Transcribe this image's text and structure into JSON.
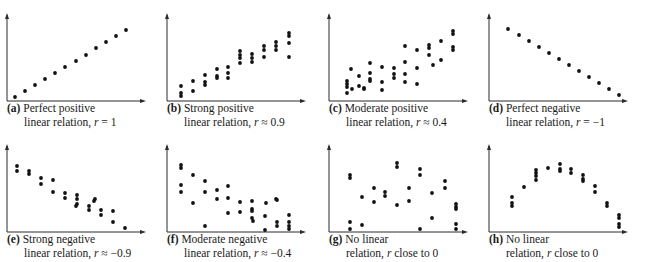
{
  "chart_data": [
    {
      "type": "scatter",
      "label": "(a)",
      "title": "Perfect positive linear relation, r = 1",
      "caption_line1": "Perfect positive",
      "caption_line2_pre": "linear relation, ",
      "caption_r": "r",
      "caption_line2_post": " = 1",
      "xlabel": "",
      "ylabel": "",
      "grid": false,
      "points": [
        [
          15,
          97
        ],
        [
          25,
          91
        ],
        [
          35,
          85
        ],
        [
          45,
          79
        ],
        [
          55,
          73
        ],
        [
          65,
          67
        ],
        [
          76,
          61
        ],
        [
          86,
          55
        ],
        [
          96,
          48
        ],
        [
          106,
          42
        ],
        [
          116,
          36
        ],
        [
          126,
          30
        ]
      ]
    },
    {
      "type": "scatter",
      "label": "(b)",
      "title": "Strong positive linear relation, r ≈ 0.9",
      "caption_line1": "Strong positive",
      "caption_line2_pre": "linear relation, ",
      "caption_r": "r",
      "caption_line2_post": " ≈ 0.9",
      "xlabel": "",
      "ylabel": "",
      "grid": false,
      "points": [
        [
          21,
          86
        ],
        [
          21,
          93
        ],
        [
          21,
          96
        ],
        [
          33,
          81
        ],
        [
          33,
          91
        ],
        [
          45,
          75
        ],
        [
          45,
          82
        ],
        [
          45,
          85
        ],
        [
          57,
          69
        ],
        [
          57,
          76
        ],
        [
          57,
          78
        ],
        [
          68,
          67
        ],
        [
          68,
          73
        ],
        [
          68,
          78
        ],
        [
          80,
          51
        ],
        [
          80,
          55
        ],
        [
          80,
          58
        ],
        [
          80,
          63
        ],
        [
          92,
          54
        ],
        [
          92,
          58
        ],
        [
          92,
          62
        ],
        [
          104,
          46
        ],
        [
          104,
          50
        ],
        [
          104,
          57
        ],
        [
          116,
          42
        ],
        [
          116,
          46
        ],
        [
          116,
          50
        ],
        [
          129,
          33
        ],
        [
          129,
          36
        ],
        [
          129,
          43
        ],
        [
          129,
          57
        ]
      ]
    },
    {
      "type": "scatter",
      "label": "(c)",
      "title": "Moderate positive linear relation, r ≈ 0.4",
      "caption_line1": "Moderate positive",
      "caption_line2_pre": "linear relation, ",
      "caption_r": "r",
      "caption_line2_post": " ≈ 0.4",
      "xlabel": "",
      "ylabel": "",
      "grid": false,
      "points": [
        [
          25,
          81
        ],
        [
          25,
          84
        ],
        [
          25,
          87
        ],
        [
          25,
          93
        ],
        [
          29,
          69
        ],
        [
          30,
          89
        ],
        [
          37,
          76
        ],
        [
          37,
          86
        ],
        [
          42,
          88
        ],
        [
          42,
          89
        ],
        [
          48,
          63
        ],
        [
          48,
          73
        ],
        [
          48,
          79
        ],
        [
          48,
          81
        ],
        [
          60,
          67
        ],
        [
          60,
          82
        ],
        [
          60,
          90
        ],
        [
          72,
          68
        ],
        [
          72,
          74
        ],
        [
          72,
          78
        ],
        [
          83,
          46
        ],
        [
          83,
          62
        ],
        [
          83,
          74
        ],
        [
          83,
          82
        ],
        [
          95,
          50
        ],
        [
          95,
          68
        ],
        [
          95,
          84
        ],
        [
          107,
          45
        ],
        [
          107,
          48
        ],
        [
          107,
          55
        ],
        [
          111,
          65
        ],
        [
          119,
          41
        ],
        [
          119,
          60
        ],
        [
          131,
          31
        ],
        [
          131,
          34
        ],
        [
          131,
          47
        ],
        [
          131,
          50
        ]
      ]
    },
    {
      "type": "scatter",
      "label": "(d)",
      "title": "Perfect negative linear relation, r = −1",
      "caption_line1": "Perfect negative",
      "caption_line2_pre": "linear relation, ",
      "caption_r": "r",
      "caption_line2_post": " = −1",
      "xlabel": "",
      "ylabel": "",
      "grid": false,
      "points": [
        [
          26,
          29
        ],
        [
          37,
          35
        ],
        [
          47,
          41
        ],
        [
          57,
          47
        ],
        [
          67,
          53
        ],
        [
          77,
          59
        ],
        [
          87,
          65
        ],
        [
          97,
          71
        ],
        [
          107,
          77
        ],
        [
          117,
          83
        ],
        [
          127,
          89
        ],
        [
          137,
          95
        ]
      ]
    },
    {
      "type": "scatter",
      "label": "(e)",
      "title": "Strong negative linear relation, r ≈ −0.9",
      "caption_line1": "Strong negative",
      "caption_line2_pre": "linear relation, ",
      "caption_r": "r",
      "caption_line2_post": " ≈ −0.9",
      "xlabel": "",
      "ylabel": "",
      "grid": false,
      "points": [
        [
          17,
          35
        ],
        [
          17,
          40
        ],
        [
          29,
          40
        ],
        [
          29,
          43
        ],
        [
          41,
          47
        ],
        [
          41,
          53
        ],
        [
          53,
          49
        ],
        [
          53,
          61
        ],
        [
          65,
          62
        ],
        [
          65,
          67
        ],
        [
          77,
          64
        ],
        [
          77,
          68
        ],
        [
          77,
          73
        ],
        [
          76,
          75
        ],
        [
          89,
          75
        ],
        [
          89,
          79
        ],
        [
          95,
          68
        ],
        [
          94,
          70
        ],
        [
          101,
          79
        ],
        [
          101,
          84
        ],
        [
          113,
          80
        ],
        [
          113,
          91
        ],
        [
          125,
          97
        ]
      ]
    },
    {
      "type": "scatter",
      "label": "(f)",
      "title": "Moderate negative linear relation, r ≈ −0.4",
      "caption_line1": "Moderate negative",
      "caption_line2_pre": "linear relation, ",
      "caption_r": "r",
      "caption_line2_post": " ≈ −0.4",
      "xlabel": "",
      "ylabel": "",
      "grid": false,
      "points": [
        [
          21,
          34
        ],
        [
          21,
          37
        ],
        [
          21,
          54
        ],
        [
          21,
          61
        ],
        [
          33,
          44
        ],
        [
          33,
          72
        ],
        [
          45,
          50
        ],
        [
          45,
          61
        ],
        [
          45,
          95
        ],
        [
          57,
          59
        ],
        [
          57,
          68
        ],
        [
          68,
          55
        ],
        [
          68,
          67
        ],
        [
          68,
          82
        ],
        [
          80,
          71
        ],
        [
          80,
          81
        ],
        [
          92,
          70
        ],
        [
          92,
          78
        ],
        [
          92,
          80
        ],
        [
          92,
          87
        ],
        [
          93,
          90
        ],
        [
          105,
          85
        ],
        [
          105,
          99
        ],
        [
          106,
          72
        ],
        [
          116,
          68
        ],
        [
          117,
          69
        ],
        [
          117,
          91
        ],
        [
          117,
          95
        ],
        [
          129,
          84
        ],
        [
          129,
          91
        ],
        [
          129,
          95
        ],
        [
          129,
          98
        ]
      ]
    },
    {
      "type": "scatter",
      "label": "(g)",
      "title": "No linear relation, r close to 0",
      "caption_line1": "No linear",
      "caption_line2_pre": "relation, ",
      "caption_r": "r",
      "caption_line2_post": " close to 0",
      "xlabel": "",
      "ylabel": "",
      "grid": false,
      "points": [
        [
          28,
          44
        ],
        [
          28,
          47
        ],
        [
          28,
          91
        ],
        [
          28,
          98
        ],
        [
          40,
          66
        ],
        [
          40,
          94
        ],
        [
          52,
          57
        ],
        [
          52,
          71
        ],
        [
          63,
          61
        ],
        [
          63,
          65
        ],
        [
          75,
          32
        ],
        [
          75,
          36
        ],
        [
          75,
          74
        ],
        [
          87,
          57
        ],
        [
          87,
          70
        ],
        [
          98,
          38
        ],
        [
          98,
          44
        ],
        [
          98,
          98
        ],
        [
          110,
          62
        ],
        [
          110,
          87
        ],
        [
          123,
          50
        ],
        [
          123,
          57
        ],
        [
          134,
          73
        ],
        [
          134,
          76
        ],
        [
          134,
          78
        ],
        [
          134,
          93
        ],
        [
          134,
          98
        ]
      ]
    },
    {
      "type": "scatter",
      "label": "(h)",
      "title": "No linear relation, r close to 0",
      "caption_line1": "No linear",
      "caption_line2_pre": "relation, ",
      "caption_r": "r",
      "caption_line2_post": " close to 0",
      "xlabel": "",
      "ylabel": "",
      "grid": false,
      "points": [
        [
          30,
          66
        ],
        [
          30,
          72
        ],
        [
          30,
          75
        ],
        [
          42,
          56
        ],
        [
          54,
          39
        ],
        [
          54,
          42
        ],
        [
          54,
          45
        ],
        [
          54,
          49
        ],
        [
          66,
          37
        ],
        [
          78,
          33
        ],
        [
          78,
          38
        ],
        [
          78,
          40
        ],
        [
          89,
          38
        ],
        [
          89,
          42
        ],
        [
          101,
          44
        ],
        [
          101,
          48
        ],
        [
          101,
          50
        ],
        [
          113,
          55
        ],
        [
          113,
          61
        ],
        [
          125,
          72
        ],
        [
          125,
          75
        ],
        [
          137,
          84
        ],
        [
          137,
          87
        ],
        [
          137,
          93
        ],
        [
          137,
          96
        ]
      ]
    }
  ]
}
